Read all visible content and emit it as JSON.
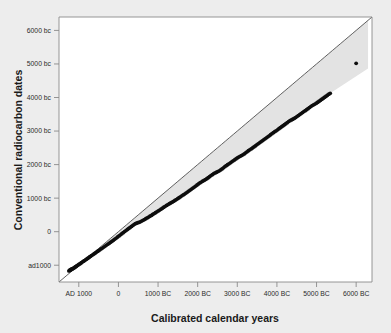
{
  "chart_data": {
    "type": "scatter",
    "title": "",
    "xlabel": "Calibrated calendar years",
    "ylabel": "Conventional radiocarbon dates",
    "grid": false,
    "legend": null,
    "xlim": [
      1500,
      -6400
    ],
    "ylim": [
      1500,
      -6400
    ],
    "x_tick_labels": [
      "AD 1000",
      "0",
      "1000 BC",
      "2000 BC",
      "3000 BC",
      "4000 BC",
      "5000 BC",
      "6000 BC"
    ],
    "x_tick_values": [
      1000,
      0,
      -1000,
      -2000,
      -3000,
      -4000,
      -5000,
      -6000
    ],
    "y_tick_labels": [
      "6000 bc",
      "5000 bc",
      "4000 bc",
      "3000 bc",
      "2000 bc",
      "1000 bc",
      "0",
      "ad1000"
    ],
    "y_tick_values": [
      -6000,
      -5000,
      -4000,
      -3000,
      -2000,
      -1000,
      0,
      1000
    ],
    "annotations": [
      "Diagonal 1:1 reference line where radiocarbon age equals calendar age",
      "Shaded band between the 1:1 line and the calibration curve shows the divergence",
      "Single isolated point at the far right near 6000 BC / 5000 bc"
    ],
    "series": [
      {
        "name": "Calibration data points",
        "marker": "filled-circle",
        "color": "#0d0d0d",
        "points": [
          [
            1250,
            1170
          ],
          [
            1230,
            1150
          ],
          [
            1215,
            1140
          ],
          [
            1200,
            1135
          ],
          [
            1190,
            1120
          ],
          [
            1175,
            1118
          ],
          [
            1160,
            1105
          ],
          [
            1145,
            1095
          ],
          [
            1120,
            1080
          ],
          [
            1100,
            1060
          ],
          [
            1080,
            1045
          ],
          [
            1060,
            1030
          ],
          [
            1040,
            1010
          ],
          [
            1020,
            995
          ],
          [
            1000,
            975
          ],
          [
            975,
            960
          ],
          [
            950,
            940
          ],
          [
            930,
            920
          ],
          [
            905,
            900
          ],
          [
            880,
            880
          ],
          [
            855,
            860
          ],
          [
            830,
            840
          ],
          [
            805,
            820
          ],
          [
            780,
            798
          ],
          [
            755,
            778
          ],
          [
            730,
            755
          ],
          [
            705,
            735
          ],
          [
            680,
            712
          ],
          [
            650,
            690
          ],
          [
            620,
            665
          ],
          [
            590,
            640
          ],
          [
            560,
            615
          ],
          [
            530,
            590
          ],
          [
            500,
            565
          ],
          [
            470,
            540
          ],
          [
            440,
            515
          ],
          [
            405,
            488
          ],
          [
            370,
            460
          ],
          [
            335,
            430
          ],
          [
            300,
            400
          ],
          [
            265,
            372
          ],
          [
            230,
            342
          ],
          [
            195,
            312
          ],
          [
            160,
            282
          ],
          [
            125,
            252
          ],
          [
            90,
            220
          ],
          [
            55,
            190
          ],
          [
            20,
            158
          ],
          [
            -15,
            126
          ],
          [
            -50,
            95
          ],
          [
            -85,
            62
          ],
          [
            -120,
            30
          ],
          [
            -155,
            -2
          ],
          [
            -190,
            -32
          ],
          [
            -225,
            -65
          ],
          [
            -260,
            -95
          ],
          [
            -295,
            -125
          ],
          [
            -330,
            -158
          ],
          [
            -365,
            -188
          ],
          [
            -400,
            -218
          ],
          [
            -430,
            -240
          ],
          [
            -460,
            -255
          ],
          [
            -490,
            -268
          ],
          [
            -520,
            -280
          ],
          [
            -550,
            -295
          ],
          [
            -585,
            -315
          ],
          [
            -620,
            -338
          ],
          [
            -655,
            -362
          ],
          [
            -690,
            -385
          ],
          [
            -725,
            -410
          ],
          [
            -760,
            -435
          ],
          [
            -795,
            -460
          ],
          [
            -830,
            -485
          ],
          [
            -865,
            -512
          ],
          [
            -900,
            -540
          ],
          [
            -935,
            -565
          ],
          [
            -970,
            -592
          ],
          [
            -1005,
            -618
          ],
          [
            -1040,
            -645
          ],
          [
            -1075,
            -672
          ],
          [
            -1110,
            -700
          ],
          [
            -1145,
            -728
          ],
          [
            -1180,
            -755
          ],
          [
            -1215,
            -782
          ],
          [
            -1250,
            -808
          ],
          [
            -1285,
            -832
          ],
          [
            -1320,
            -855
          ],
          [
            -1355,
            -880
          ],
          [
            -1390,
            -905
          ],
          [
            -1425,
            -930
          ],
          [
            -1460,
            -958
          ],
          [
            -1495,
            -985
          ],
          [
            -1530,
            -1012
          ],
          [
            -1565,
            -1040
          ],
          [
            -1600,
            -1068
          ],
          [
            -1635,
            -1095
          ],
          [
            -1670,
            -1122
          ],
          [
            -1705,
            -1150
          ],
          [
            -1740,
            -1180
          ],
          [
            -1775,
            -1210
          ],
          [
            -1810,
            -1240
          ],
          [
            -1845,
            -1270
          ],
          [
            -1880,
            -1300
          ],
          [
            -1915,
            -1330
          ],
          [
            -1950,
            -1360
          ],
          [
            -1985,
            -1392
          ],
          [
            -2020,
            -1425
          ],
          [
            -2055,
            -1455
          ],
          [
            -2090,
            -1480
          ],
          [
            -2125,
            -1505
          ],
          [
            -2160,
            -1528
          ],
          [
            -2195,
            -1552
          ],
          [
            -2230,
            -1578
          ],
          [
            -2265,
            -1608
          ],
          [
            -2300,
            -1640
          ],
          [
            -2335,
            -1672
          ],
          [
            -2370,
            -1700
          ],
          [
            -2405,
            -1728
          ],
          [
            -2440,
            -1752
          ],
          [
            -2475,
            -1772
          ],
          [
            -2510,
            -1792
          ],
          [
            -2545,
            -1815
          ],
          [
            -2580,
            -1842
          ],
          [
            -2615,
            -1872
          ],
          [
            -2650,
            -1905
          ],
          [
            -2685,
            -1938
          ],
          [
            -2720,
            -1968
          ],
          [
            -2755,
            -1995
          ],
          [
            -2790,
            -2022
          ],
          [
            -2825,
            -2052
          ],
          [
            -2860,
            -2082
          ],
          [
            -2895,
            -2112
          ],
          [
            -2930,
            -2140
          ],
          [
            -2965,
            -2168
          ],
          [
            -3000,
            -2198
          ],
          [
            -3035,
            -2225
          ],
          [
            -3070,
            -2248
          ],
          [
            -3105,
            -2268
          ],
          [
            -3140,
            -2290
          ],
          [
            -3175,
            -2318
          ],
          [
            -3210,
            -2350
          ],
          [
            -3245,
            -2382
          ],
          [
            -3280,
            -2412
          ],
          [
            -3315,
            -2440
          ],
          [
            -3350,
            -2468
          ],
          [
            -3385,
            -2498
          ],
          [
            -3420,
            -2528
          ],
          [
            -3455,
            -2558
          ],
          [
            -3490,
            -2588
          ],
          [
            -3525,
            -2618
          ],
          [
            -3560,
            -2648
          ],
          [
            -3595,
            -2678
          ],
          [
            -3630,
            -2708
          ],
          [
            -3665,
            -2738
          ],
          [
            -3700,
            -2768
          ],
          [
            -3735,
            -2798
          ],
          [
            -3770,
            -2828
          ],
          [
            -3805,
            -2858
          ],
          [
            -3840,
            -2890
          ],
          [
            -3875,
            -2922
          ],
          [
            -3910,
            -2952
          ],
          [
            -3945,
            -2980
          ],
          [
            -3980,
            -3008
          ],
          [
            -4015,
            -3038
          ],
          [
            -4050,
            -3068
          ],
          [
            -4085,
            -3098
          ],
          [
            -4120,
            -3128
          ],
          [
            -4155,
            -3158
          ],
          [
            -4190,
            -3188
          ],
          [
            -4225,
            -3218
          ],
          [
            -4260,
            -3250
          ],
          [
            -4295,
            -3282
          ],
          [
            -4330,
            -3310
          ],
          [
            -4365,
            -3332
          ],
          [
            -4400,
            -3352
          ],
          [
            -4435,
            -3375
          ],
          [
            -4470,
            -3402
          ],
          [
            -4505,
            -3432
          ],
          [
            -4540,
            -3462
          ],
          [
            -4575,
            -3492
          ],
          [
            -4610,
            -3522
          ],
          [
            -4645,
            -3552
          ],
          [
            -4680,
            -3580
          ],
          [
            -4715,
            -3608
          ],
          [
            -4750,
            -3638
          ],
          [
            -4785,
            -3668
          ],
          [
            -4820,
            -3700
          ],
          [
            -4855,
            -3730
          ],
          [
            -4890,
            -3758
          ],
          [
            -4925,
            -3782
          ],
          [
            -4960,
            -3805
          ],
          [
            -4995,
            -3830
          ],
          [
            -5030,
            -3858
          ],
          [
            -5065,
            -3888
          ],
          [
            -5100,
            -3918
          ],
          [
            -5135,
            -3948
          ],
          [
            -5170,
            -3978
          ],
          [
            -5205,
            -4008
          ],
          [
            -5240,
            -4038
          ],
          [
            -5275,
            -4068
          ],
          [
            -5310,
            -4098
          ],
          [
            -5345,
            -4125
          ],
          [
            -6000,
            -5020
          ]
        ]
      }
    ]
  },
  "axes": {
    "x_title": "Calibrated calendar years",
    "y_title": "Conventional radiocarbon dates",
    "x_ticks": [
      {
        "label": "AD 1000",
        "value": 1000
      },
      {
        "label": "0",
        "value": 0
      },
      {
        "label": "1000 BC",
        "value": -1000
      },
      {
        "label": "2000 BC",
        "value": -2000
      },
      {
        "label": "3000 BC",
        "value": -3000
      },
      {
        "label": "4000 BC",
        "value": -4000
      },
      {
        "label": "5000 BC",
        "value": -5000
      },
      {
        "label": "6000 BC",
        "value": -6000
      }
    ],
    "y_ticks": [
      {
        "label": "6000 bc",
        "value": -6000
      },
      {
        "label": "5000 bc",
        "value": -5000
      },
      {
        "label": "4000 bc",
        "value": -4000
      },
      {
        "label": "3000 bc",
        "value": -3000
      },
      {
        "label": "2000 bc",
        "value": -2000
      },
      {
        "label": "1000 bc",
        "value": -1000
      },
      {
        "label": "0",
        "value": 0
      },
      {
        "label": "ad1000",
        "value": 1000
      }
    ]
  },
  "colors": {
    "page_background": "#ededed",
    "plot_background": "#ffffff",
    "band_fill": "#e3e3e3",
    "frame": "#8a8a8a",
    "reference_line": "#3a3a3a",
    "point": "#0d0d0d",
    "text": "#1a1a1a"
  }
}
